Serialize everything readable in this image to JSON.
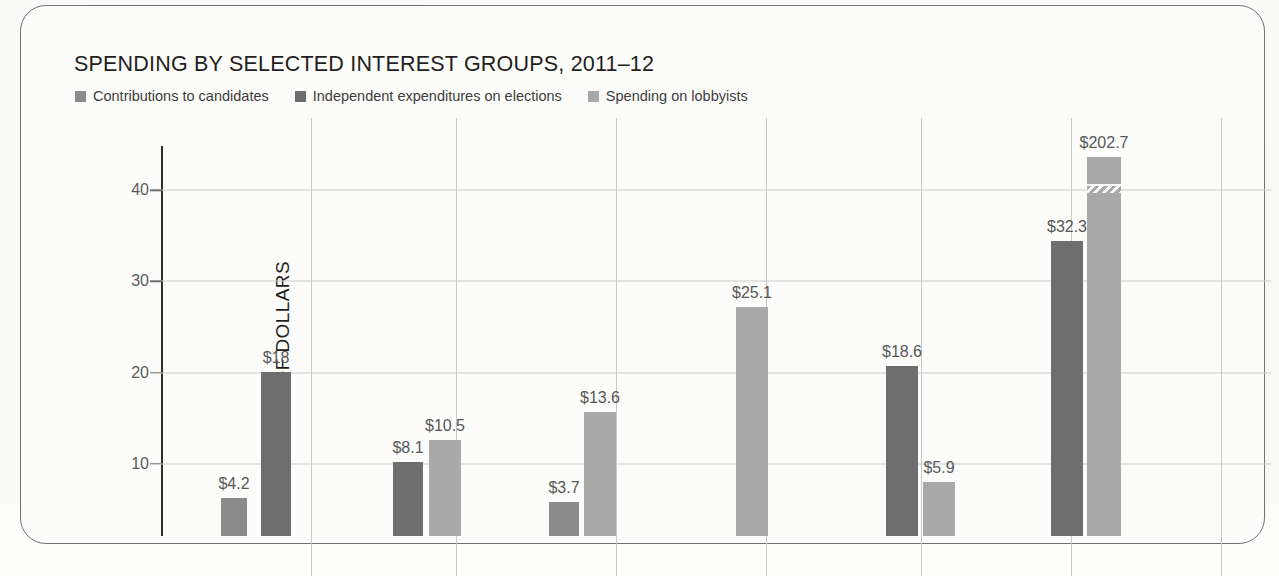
{
  "card": {
    "ghost_text": " "
  },
  "header": {
    "title": "SPENDING BY SELECTED INTEREST GROUPS, 2011–12"
  },
  "legend": {
    "items": [
      {
        "label": "Contributions to candidates",
        "color": "#8b8b8b",
        "key": "contributions"
      },
      {
        "label": "Independent expenditures on elections",
        "color": "#6e6e6e",
        "key": "independent"
      },
      {
        "label": "Spending on lobbyists",
        "color": "#a9a9a9",
        "key": "lobbyists"
      }
    ]
  },
  "axes": {
    "ylabel": "MILLIONS OF DOLLARS",
    "yticks": [
      "10",
      "20",
      "30",
      "40"
    ]
  },
  "chart_data": {
    "type": "bar",
    "title": "SPENDING BY SELECTED INTEREST GROUPS, 2011–12",
    "xlabel": "",
    "ylabel": "MILLIONS OF DOLLARS",
    "ylim": [
      0,
      45
    ],
    "ytick_values": [
      10,
      20,
      30,
      40
    ],
    "grid": true,
    "legend_position": "top-left",
    "units": "millions of dollars",
    "axis_break": true,
    "axis_break_note": "Final lobbyists bar ($202.7) is drawn with a zigzag break because it exceeds the axis scale.",
    "series": [
      {
        "name": "Contributions to candidates",
        "color": "#8b8b8b"
      },
      {
        "name": "Independent expenditures on elections",
        "color": "#6e6e6e"
      },
      {
        "name": "Spending on lobbyists",
        "color": "#a9a9a9"
      }
    ],
    "groups": [
      {
        "index": 1,
        "bars": [
          {
            "series": "Contributions to candidates",
            "value": 4.2,
            "label": "$4.2"
          },
          {
            "series": "Independent expenditures on elections",
            "value": 18,
            "label": "$18"
          }
        ]
      },
      {
        "index": 2,
        "bars": [
          {
            "series": "Independent expenditures on elections",
            "value": 8.1,
            "label": "$8.1"
          },
          {
            "series": "Spending on lobbyists",
            "value": 10.5,
            "label": "$10.5"
          }
        ]
      },
      {
        "index": 3,
        "bars": [
          {
            "series": "Contributions to candidates",
            "value": 3.7,
            "label": "$3.7"
          },
          {
            "series": "Spending on lobbyists",
            "value": 13.6,
            "label": "$13.6"
          }
        ]
      },
      {
        "index": 4,
        "bars": [
          {
            "series": "Spending on lobbyists",
            "value": 25.1,
            "label": "$25.1"
          }
        ]
      },
      {
        "index": 5,
        "bars": [
          {
            "series": "Independent expenditures on elections",
            "value": 18.6,
            "label": "$18.6"
          },
          {
            "series": "Spending on lobbyists",
            "value": 5.9,
            "label": "$5.9"
          }
        ]
      },
      {
        "index": 6,
        "bars": [
          {
            "series": "Independent expenditures on elections",
            "value": 32.3,
            "label": "$32.3"
          },
          {
            "series": "Spending on lobbyists",
            "value": 202.7,
            "label": "$202.7",
            "broken": true
          }
        ]
      }
    ]
  }
}
